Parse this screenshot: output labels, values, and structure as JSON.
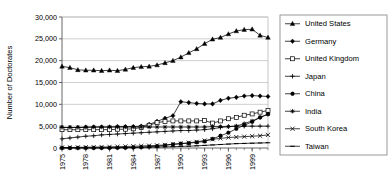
{
  "chart_data": {
    "type": "line",
    "title": "",
    "xlabel": "",
    "ylabel": "Number of Doctorates",
    "xlim": [
      1975,
      2001
    ],
    "ylim": [
      0,
      30000
    ],
    "ytick_values": [
      0,
      5000,
      10000,
      15000,
      20000,
      25000,
      30000
    ],
    "ytick_labels": [
      "0",
      "5,000",
      "10,000",
      "15,000",
      "20,000",
      "25,000",
      "30,000"
    ],
    "xtick_values": [
      1975,
      1978,
      1981,
      1984,
      1987,
      1990,
      1993,
      1996,
      1999
    ],
    "xtick_labels": [
      "1975",
      "1978",
      "1981",
      "1984",
      "1987",
      "1990",
      "1993",
      "1996",
      "1999"
    ],
    "x": [
      1975,
      1976,
      1977,
      1978,
      1979,
      1980,
      1981,
      1982,
      1983,
      1984,
      1985,
      1986,
      1987,
      1988,
      1989,
      1990,
      1991,
      1992,
      1993,
      1994,
      1995,
      1996,
      1997,
      1998,
      1999,
      2000,
      2001
    ],
    "grid": "horizontal",
    "legend_position": "right",
    "series": [
      {
        "name": "United States",
        "marker": "filled-triangle",
        "values": [
          18700,
          18400,
          17900,
          17800,
          17800,
          17700,
          17800,
          17700,
          18000,
          18400,
          18600,
          18700,
          19000,
          19500,
          20000,
          20800,
          21800,
          22700,
          23900,
          24900,
          25300,
          26100,
          26800,
          27100,
          27200,
          25800,
          25300
        ]
      },
      {
        "name": "Germany",
        "marker": "filled-diamond",
        "values": [
          4700,
          4700,
          4700,
          4800,
          4800,
          4800,
          4800,
          4900,
          4900,
          4900,
          5000,
          5400,
          6100,
          6800,
          7400,
          10600,
          10400,
          10200,
          10100,
          10100,
          10900,
          11400,
          11600,
          11900,
          12000,
          11900,
          11800
        ]
      },
      {
        "name": "United Kingdom",
        "marker": "open-square",
        "values": [
          4200,
          4200,
          4200,
          4200,
          4200,
          4200,
          4200,
          4300,
          4300,
          4400,
          4700,
          5200,
          5800,
          6100,
          6200,
          6200,
          6200,
          6200,
          6300,
          5700,
          6200,
          6700,
          7000,
          7500,
          7800,
          8200,
          8600
        ]
      },
      {
        "name": "Japan",
        "marker": "plus",
        "values": [
          2100,
          2300,
          2500,
          2700,
          2800,
          3000,
          3100,
          3200,
          3300,
          3400,
          3500,
          3600,
          3700,
          3800,
          3900,
          4000,
          4000,
          4100,
          4200,
          4400,
          4700,
          4900,
          5000,
          5000,
          5000,
          5000,
          5000
        ]
      },
      {
        "name": "China",
        "marker": "filled-circle",
        "values": [
          0,
          0,
          0,
          0,
          0,
          0,
          0,
          30,
          60,
          120,
          200,
          300,
          400,
          600,
          850,
          1000,
          1100,
          1300,
          1500,
          2100,
          2800,
          3500,
          4400,
          5200,
          6000,
          7000,
          7800
        ]
      },
      {
        "name": "India",
        "marker": "asterisk",
        "values": [
          4700,
          4700,
          4700,
          4700,
          4800,
          4800,
          4800,
          4800,
          4800,
          4800,
          4800,
          4800,
          4800,
          4800,
          4800,
          4800,
          4800,
          4800,
          4800,
          4900,
          4900,
          4900,
          5000,
          5600,
          6200,
          7000,
          7700
        ]
      },
      {
        "name": "South Korea",
        "marker": "x-cross",
        "values": [
          100,
          120,
          150,
          180,
          200,
          230,
          260,
          300,
          350,
          400,
          460,
          520,
          600,
          700,
          850,
          1000,
          1200,
          1400,
          1700,
          2000,
          2200,
          2400,
          2500,
          2600,
          2700,
          2800,
          3000
        ]
      },
      {
        "name": "Taiwan",
        "marker": "dash",
        "values": [
          20,
          25,
          30,
          40,
          50,
          60,
          70,
          80,
          100,
          120,
          150,
          180,
          220,
          260,
          300,
          360,
          420,
          500,
          600,
          700,
          800,
          900,
          1000,
          1050,
          1100,
          1150,
          1200
        ]
      }
    ]
  },
  "axis": {
    "ylabel": "Number of Doctorates"
  },
  "legend": {
    "items": [
      {
        "label": "United States"
      },
      {
        "label": "Germany"
      },
      {
        "label": "United Kingdom"
      },
      {
        "label": "Japan"
      },
      {
        "label": "China"
      },
      {
        "label": "India"
      },
      {
        "label": "South Korea"
      },
      {
        "label": "Taiwan"
      }
    ]
  }
}
